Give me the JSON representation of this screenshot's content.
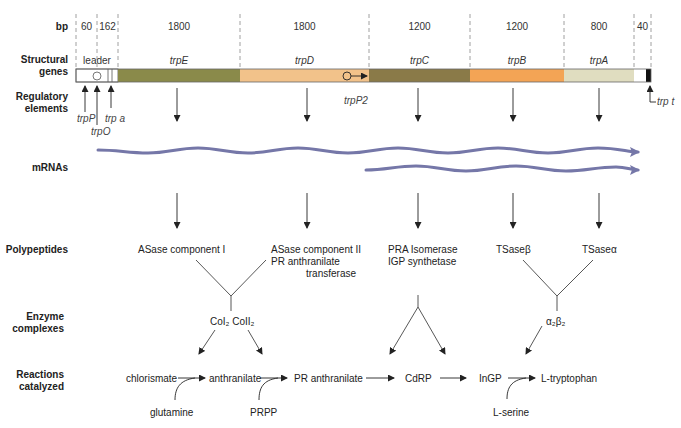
{
  "row_labels": {
    "bp": "bp",
    "structural_genes": [
      "Structural",
      "genes"
    ],
    "regulatory_elements": [
      "Regulatory",
      "elements"
    ],
    "mrnas": "mRNAs",
    "polypeptides": "Polypeptides",
    "enzyme_complexes": [
      "Enzyme",
      "complexes"
    ],
    "reactions_catalyzed": [
      "Reactions",
      "catalyzed"
    ]
  },
  "bp_values": [
    "60",
    "162",
    "1800",
    "1800",
    "1200",
    "1200",
    "800",
    "40"
  ],
  "genes": [
    {
      "name": "leader",
      "italic_prefix": "",
      "color": "#ffffff"
    },
    {
      "name": "trpE",
      "italic_prefix": "trp",
      "suffix": "E",
      "color": "#8a8a4a"
    },
    {
      "name": "trpD",
      "italic_prefix": "trp",
      "suffix": "D",
      "color": "#f2c28a"
    },
    {
      "name": "trpC",
      "italic_prefix": "trp",
      "suffix": "C",
      "color": "#8a7a48"
    },
    {
      "name": "trpB",
      "italic_prefix": "trp",
      "suffix": "B",
      "color": "#f3a455"
    },
    {
      "name": "trpA",
      "italic_prefix": "trp",
      "suffix": "A",
      "color": "#e0ddc0"
    }
  ],
  "regulatory": {
    "trpP": "trpP",
    "trpO": "trpO",
    "trpa": "trp a",
    "trpP2": "trpP2",
    "trpt": "trp t"
  },
  "mrna_color": "#7577a8",
  "polypeptides": {
    "asase1": "ASase component I",
    "asase2": [
      "ASase component II",
      "PR anthranilate",
      "transferase"
    ],
    "pra": [
      "PRA Isomerase",
      "IGP synthetase"
    ],
    "tsaseb": "TSaseβ",
    "tsasea": "TSaseα"
  },
  "enzyme_complexes": {
    "col": "CoI₂ CoII₂",
    "ab": "α₂β₂"
  },
  "reactions": {
    "chorismate": "chlorismate",
    "anthranilate": "anthranilate",
    "pr_anthranilate": "PR anthranilate",
    "cdrp": "CdRP",
    "ingp": "InGP",
    "tryptophan": "L-tryptophan",
    "glutamine": "glutamine",
    "prpp": "PRPP",
    "serine": "L-serine"
  }
}
